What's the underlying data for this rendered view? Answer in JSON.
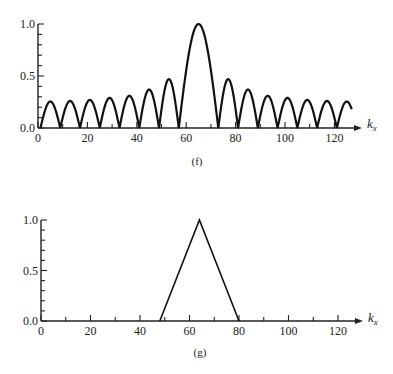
{
  "chart_data": [
    {
      "id": "f",
      "type": "line",
      "caption": "(f)",
      "title": "",
      "xlabel": "k_x",
      "xlabel_main": "k",
      "xlabel_sub": "x",
      "ylabel": "",
      "xlim": [
        0,
        128
      ],
      "ylim": [
        0,
        1.0
      ],
      "xticks": [
        0,
        20,
        40,
        60,
        80,
        100,
        120
      ],
      "xtick_labels": [
        "0",
        "20",
        "40",
        "60",
        "80",
        "100",
        "120"
      ],
      "yticks": [
        0.0,
        0.5,
        1.0
      ],
      "ytick_labels": [
        "0.0",
        "0.5",
        "1.0"
      ],
      "grid": false,
      "legend": null,
      "description": "Magnitude of a sinc-like (Dirichlet) spectrum: main lobe centered at k=65 with height 1.0, sidelobes of width 8 decaying toward the edges",
      "lobes": [
        {
          "start": 1,
          "end": 9,
          "peak": 0.255
        },
        {
          "start": 9,
          "end": 17,
          "peak": 0.26
        },
        {
          "start": 17,
          "end": 25,
          "peak": 0.27
        },
        {
          "start": 25,
          "end": 33,
          "peak": 0.29
        },
        {
          "start": 33,
          "end": 41,
          "peak": 0.31
        },
        {
          "start": 41,
          "end": 49,
          "peak": 0.37
        },
        {
          "start": 49,
          "end": 57,
          "peak": 0.47
        },
        {
          "start": 57,
          "end": 73,
          "peak": 1.0
        },
        {
          "start": 73,
          "end": 81,
          "peak": 0.47
        },
        {
          "start": 81,
          "end": 89,
          "peak": 0.37
        },
        {
          "start": 89,
          "end": 97,
          "peak": 0.31
        },
        {
          "start": 97,
          "end": 105,
          "peak": 0.29
        },
        {
          "start": 105,
          "end": 113,
          "peak": 0.27
        },
        {
          "start": 113,
          "end": 121,
          "peak": 0.26
        },
        {
          "start": 121,
          "end": 129,
          "peak": 0.255,
          "clip_at": 127
        }
      ]
    },
    {
      "id": "g",
      "type": "line",
      "caption": "(g)",
      "title": "",
      "xlabel": "k_x",
      "xlabel_main": "k",
      "xlabel_sub": "x",
      "ylabel": "",
      "xlim": [
        0,
        128
      ],
      "ylim": [
        0,
        1.0
      ],
      "xticks": [
        0,
        20,
        40,
        60,
        80,
        100,
        120
      ],
      "xtick_labels": [
        "0",
        "20",
        "40",
        "60",
        "80",
        "100",
        "120"
      ],
      "yticks": [
        0.0,
        0.5,
        1.0
      ],
      "ytick_labels": [
        "0.0",
        "0.5",
        "1.0"
      ],
      "grid": false,
      "legend": null,
      "description": "Triangular window: zero outside [48, 80], rising linearly to 1.0 at k=64",
      "x": [
        48,
        64,
        80
      ],
      "values": [
        0.0,
        1.0,
        0.0
      ]
    }
  ]
}
